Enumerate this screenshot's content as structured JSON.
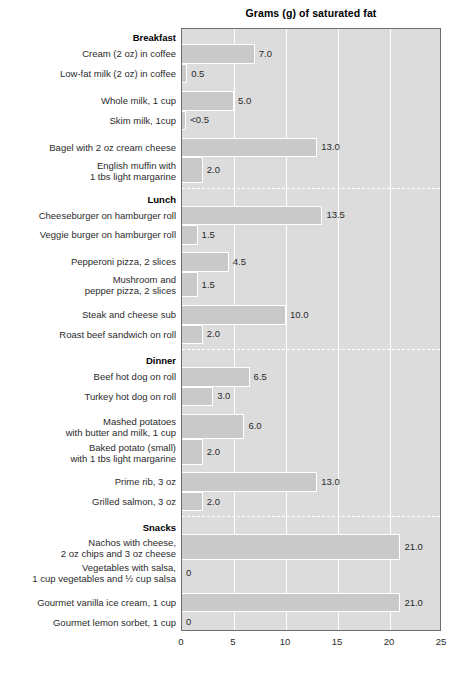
{
  "chart_data": {
    "type": "bar",
    "orientation": "horizontal",
    "title": "Grams (g) of saturated fat",
    "xlabel": "",
    "ylabel": "",
    "xlim": [
      0,
      25
    ],
    "xticks": [
      0,
      5,
      10,
      15,
      20,
      25
    ],
    "xtick_labels": [
      "0",
      "5",
      "10",
      "15",
      "20",
      "25"
    ],
    "grid": true,
    "legend": "none",
    "colors": {
      "bar_fill": "#c9c9c9",
      "plot_background": "#dcdcdc",
      "gridline": "#ffffff",
      "frame": "#6e6e6e",
      "text": "#2b2b2b"
    },
    "sections": [
      {
        "heading": "Breakfast",
        "groups": [
          [
            {
              "label": "Cream (2 oz) in coffee",
              "value": 7.0,
              "value_label": "7.0"
            },
            {
              "label": "Low-fat milk (2 oz) in coffee",
              "value": 0.5,
              "value_label": "0.5"
            }
          ],
          [
            {
              "label": "Whole milk, 1 cup",
              "value": 5.0,
              "value_label": "5.0"
            },
            {
              "label": "Skim milk, 1cup",
              "value": 0.4,
              "value_label": "<0.5"
            }
          ],
          [
            {
              "label": "Bagel with 2 oz cream cheese",
              "value": 13.0,
              "value_label": "13.0"
            },
            {
              "label": "English muffin with\n1 tbs light margarine",
              "value": 2.0,
              "value_label": "2.0"
            }
          ]
        ]
      },
      {
        "heading": "Lunch",
        "groups": [
          [
            {
              "label": "Cheeseburger on hamburger roll",
              "value": 13.5,
              "value_label": "13.5"
            },
            {
              "label": "Veggie burger on hamburger roll",
              "value": 1.5,
              "value_label": "1.5"
            }
          ],
          [
            {
              "label": "Pepperoni pizza, 2 slices",
              "value": 4.5,
              "value_label": "4.5"
            },
            {
              "label": "Mushroom and\npepper pizza, 2 slices",
              "value": 1.5,
              "value_label": "1.5"
            }
          ],
          [
            {
              "label": "Steak and cheese sub",
              "value": 10.0,
              "value_label": "10.0"
            },
            {
              "label": "Roast beef sandwich on roll",
              "value": 2.0,
              "value_label": "2.0"
            }
          ]
        ]
      },
      {
        "heading": "Dinner",
        "groups": [
          [
            {
              "label": "Beef hot dog on roll",
              "value": 6.5,
              "value_label": "6.5"
            },
            {
              "label": "Turkey hot dog on roll",
              "value": 3.0,
              "value_label": "3.0"
            }
          ],
          [
            {
              "label": "Mashed potatoes\nwith butter and milk, 1 cup",
              "value": 6.0,
              "value_label": "6.0"
            },
            {
              "label": "Baked potato (small)\nwith 1 tbs light margarine",
              "value": 2.0,
              "value_label": "2.0"
            }
          ],
          [
            {
              "label": "Prime rib, 3 oz",
              "value": 13.0,
              "value_label": "13.0"
            },
            {
              "label": "Grilled salmon, 3 oz",
              "value": 2.0,
              "value_label": "2.0"
            }
          ]
        ]
      },
      {
        "heading": "Snacks",
        "groups": [
          [
            {
              "label": "Nachos with cheese,\n2 oz chips and 3 oz cheese",
              "value": 21.0,
              "value_label": "21.0"
            },
            {
              "label": "Vegetables with salsa,\n1 cup vegetables and ½ cup salsa",
              "value": 0,
              "value_label": "0"
            }
          ],
          [
            {
              "label": "Gourmet vanilla ice cream, 1 cup",
              "value": 21.0,
              "value_label": "21.0"
            },
            {
              "label": "Gourmet lemon sorbet, 1 cup",
              "value": 0,
              "value_label": "0"
            }
          ]
        ]
      }
    ]
  }
}
